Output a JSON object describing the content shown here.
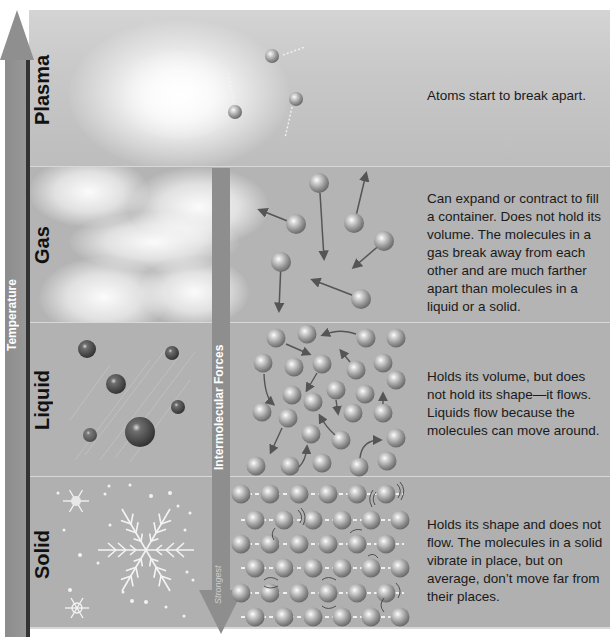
{
  "axes": {
    "temperature": {
      "label": "Temperature",
      "direction": "up"
    },
    "intermolecular_forces": {
      "label": "Intermolecular Forces",
      "end_label": "Strongest",
      "direction": "down"
    }
  },
  "states": [
    {
      "name": "Plasma",
      "description": "Atoms start to break apart."
    },
    {
      "name": "Gas",
      "description": "Can expand or contract to fill a container. Does not hold its volume. The molecules in a gas break away from each other and are much farther apart than molecules in a liquid or a solid."
    },
    {
      "name": "Liquid",
      "description": "Holds its volume, but does not hold its shape—it flows. Liquids flow because the molecules can move around."
    },
    {
      "name": "Solid",
      "description": "Holds its shape and does not flow. The molecules in a solid vibrate in place, but on average, don’t move far from their places."
    }
  ],
  "icons": {
    "plasma": "glowing-cloud",
    "gas": "clouds",
    "liquid": "droplets",
    "solid": "snowflakes"
  },
  "colors": {
    "background": "#b5b5b5",
    "axis": "#8e8e8e",
    "axis_line": "#333333",
    "text": "#1a1a1a",
    "axis_text": "#ffffff"
  }
}
